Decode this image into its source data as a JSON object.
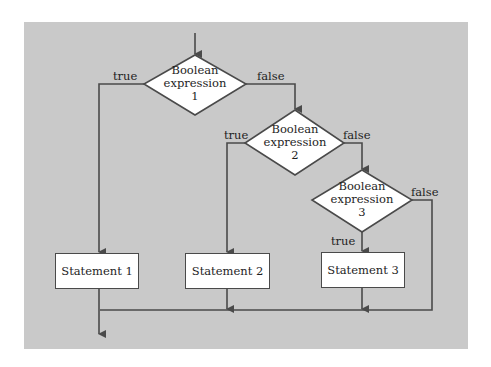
{
  "colors": {
    "background": "#ffffff",
    "panel": "#c9c9c9",
    "line": "#4a4a4a",
    "shape_fill": "#ffffff",
    "text": "#1e1e1e"
  },
  "decisions": [
    {
      "line1": "Boolean",
      "line2": "expression",
      "line3": "1",
      "true_label": "true",
      "false_label": "false"
    },
    {
      "line1": "Boolean",
      "line2": "expression",
      "line3": "2",
      "true_label": "true",
      "false_label": "false"
    },
    {
      "line1": "Boolean",
      "line2": "expression",
      "line3": "3",
      "true_label": "true",
      "false_label": "false"
    }
  ],
  "statements": [
    {
      "label": "Statement 1"
    },
    {
      "label": "Statement 2"
    },
    {
      "label": "Statement 3"
    }
  ]
}
